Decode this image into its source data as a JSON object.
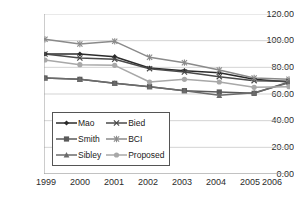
{
  "chart_data": {
    "type": "line",
    "title": "",
    "xlabel": "",
    "ylabel": "",
    "x": [
      1999,
      2000,
      2001,
      2002,
      2003,
      2004,
      2005,
      2006
    ],
    "categories": [
      "1999",
      "2000",
      "2001",
      "2002",
      "2003",
      "2004",
      "2005",
      "2006"
    ],
    "xtick_labels": [
      "1999",
      "2000",
      "2001",
      "2002",
      "2003",
      "2004",
      "2005",
      "2006"
    ],
    "ytick_labels": [
      "0.00",
      "20.00",
      "40.00",
      "60.00",
      "80.00",
      "100.00",
      "120.00"
    ],
    "ytick_values": [
      0,
      20,
      40,
      60,
      80,
      100,
      120
    ],
    "ylim": [
      0,
      120
    ],
    "grid": "horizontal",
    "legend_position": "lower-left-inside",
    "series": [
      {
        "name": "Mao",
        "marker": "diamond",
        "color": "#2b2b2b",
        "values": [
          90.0,
          90.0,
          88.0,
          79.5,
          77.5,
          76.0,
          71.0,
          69.0
        ]
      },
      {
        "name": "Bied",
        "marker": "cross",
        "color": "#4a4a4a",
        "values": [
          90.0,
          87.0,
          86.0,
          79.0,
          76.5,
          73.0,
          70.0,
          69.5
        ]
      },
      {
        "name": "Smith",
        "marker": "square",
        "color": "#5a5a5a",
        "values": [
          72.0,
          71.0,
          68.0,
          65.5,
          62.5,
          61.5,
          60.5,
          69.0
        ]
      },
      {
        "name": "BCI",
        "marker": "star",
        "color": "#8a8a8a",
        "values": [
          101.0,
          97.5,
          99.5,
          87.5,
          83.5,
          78.0,
          72.0,
          71.0
        ]
      },
      {
        "name": "Sibley",
        "marker": "triangle",
        "color": "#6b6b6b",
        "values": [
          72.0,
          71.0,
          68.0,
          65.5,
          62.5,
          59.0,
          61.0,
          68.5
        ]
      },
      {
        "name": "Proposed",
        "marker": "circle",
        "color": "#a8a8a8",
        "values": [
          85.5,
          82.0,
          81.5,
          69.0,
          71.0,
          69.0,
          65.0,
          65.5
        ]
      }
    ]
  },
  "legend": {
    "items": [
      {
        "label": "Mao"
      },
      {
        "label": "Bied"
      },
      {
        "label": "Smith"
      },
      {
        "label": "BCI"
      },
      {
        "label": "Sibley"
      },
      {
        "label": "Proposed"
      }
    ]
  }
}
